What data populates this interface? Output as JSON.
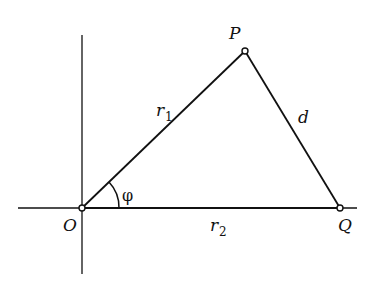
{
  "diagram": {
    "points": {
      "O": {
        "label": "O",
        "x": 82,
        "y": 208
      },
      "P": {
        "label": "P",
        "x": 245,
        "y": 51
      },
      "Q": {
        "label": "Q",
        "x": 340,
        "y": 208
      }
    },
    "edges": {
      "OP": {
        "label": "r",
        "sub": "1"
      },
      "OQ": {
        "label": "r",
        "sub": "2"
      },
      "PQ": {
        "label": "d"
      }
    },
    "angle": {
      "label": "φ"
    },
    "colors": {
      "stroke": "#111111",
      "background": "#ffffff"
    }
  }
}
